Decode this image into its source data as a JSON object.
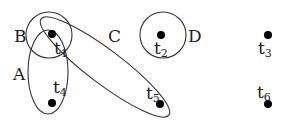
{
  "diagram": {
    "type": "hypergraph",
    "sets": [
      {
        "id": "A",
        "label": "A",
        "members": [
          "t1",
          "t4"
        ]
      },
      {
        "id": "B",
        "label": "B",
        "members": [
          "t1"
        ]
      },
      {
        "id": "C",
        "label": "C",
        "members": [
          "t1",
          "t5"
        ]
      },
      {
        "id": "D",
        "label": "D",
        "members": [
          "t2"
        ]
      }
    ],
    "nodes": [
      {
        "id": "t1",
        "base": "t",
        "sub": "1"
      },
      {
        "id": "t2",
        "base": "t",
        "sub": "2"
      },
      {
        "id": "t3",
        "base": "t",
        "sub": "3"
      },
      {
        "id": "t4",
        "base": "t",
        "sub": "4"
      },
      {
        "id": "t5",
        "base": "t",
        "sub": "5"
      },
      {
        "id": "t6",
        "base": "t",
        "sub": "6"
      }
    ]
  }
}
